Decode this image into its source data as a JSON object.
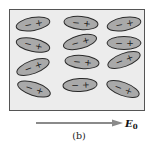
{
  "diagram": {
    "caption": "(b)",
    "field_label": "E",
    "field_subscript": "0",
    "colors": {
      "box_fill": "#ececec",
      "box_stroke": "#555555",
      "molecule_fill": "#a9a9a9",
      "molecule_stroke": "#2a2a2a",
      "sign_color": "#1a1a1a",
      "arrow_color": "#8a8a8a"
    },
    "molecules": [
      {
        "cx": 33,
        "cy": 24,
        "rot": -10,
        "neg": "−",
        "pos": "+"
      },
      {
        "cx": 81,
        "cy": 23,
        "rot": 5,
        "neg": "−",
        "pos": "+"
      },
      {
        "cx": 124,
        "cy": 24,
        "rot": -10,
        "neg": "−",
        "pos": "+"
      },
      {
        "cx": 33,
        "cy": 45,
        "rot": 12,
        "neg": "−",
        "pos": "+"
      },
      {
        "cx": 80,
        "cy": 42,
        "rot": -15,
        "neg": "−",
        "pos": "+"
      },
      {
        "cx": 124,
        "cy": 43,
        "rot": 0,
        "neg": "−",
        "pos": "+"
      },
      {
        "cx": 33,
        "cy": 67,
        "rot": -20,
        "neg": "−",
        "pos": "+"
      },
      {
        "cx": 82,
        "cy": 62,
        "rot": 5,
        "neg": "−",
        "pos": "+"
      },
      {
        "cx": 124,
        "cy": 60,
        "rot": -20,
        "neg": "−",
        "pos": "+"
      },
      {
        "cx": 34,
        "cy": 89,
        "rot": 18,
        "neg": "−",
        "pos": "+"
      },
      {
        "cx": 80,
        "cy": 85,
        "rot": -3,
        "neg": "−",
        "pos": "+"
      },
      {
        "cx": 123,
        "cy": 89,
        "rot": 20,
        "neg": "−",
        "pos": "+"
      }
    ]
  }
}
